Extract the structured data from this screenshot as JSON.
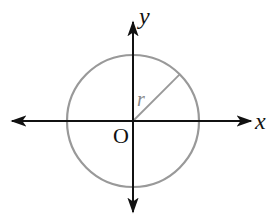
{
  "diagram": {
    "labels": {
      "x_axis": "x",
      "y_axis": "y",
      "origin": "O",
      "radius": "r"
    },
    "colors": {
      "axis": "#111111",
      "circle": "#999999",
      "radius_line": "#999999",
      "background": "#ffffff"
    },
    "geometry": {
      "origin": [
        133,
        121
      ],
      "circle_radius_px": 66,
      "radius_angle_deg": 45
    }
  }
}
